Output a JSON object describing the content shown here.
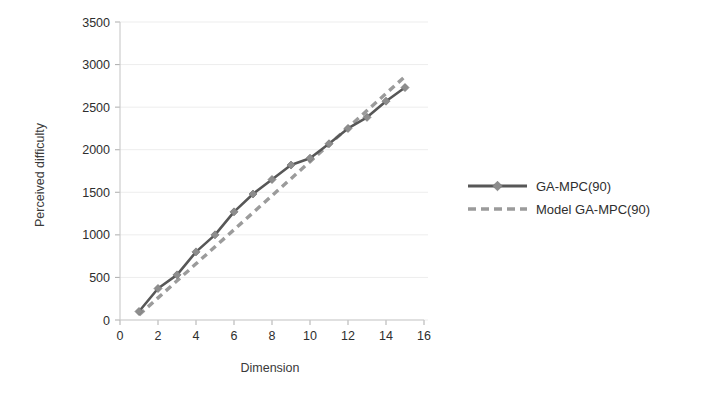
{
  "chart_data": {
    "type": "line",
    "title": "",
    "xlabel": "Dimension",
    "ylabel": "Perceived difficulty",
    "xlim": [
      0,
      16
    ],
    "ylim": [
      0,
      3500
    ],
    "xticks": [
      "0",
      "2",
      "4",
      "6",
      "8",
      "10",
      "12",
      "14",
      "16"
    ],
    "xtick_values": [
      0,
      2,
      4,
      6,
      8,
      10,
      12,
      14,
      16
    ],
    "yticks": [
      "0",
      "500",
      "1000",
      "1500",
      "2000",
      "2500",
      "3000",
      "3500"
    ],
    "ytick_values": [
      0,
      500,
      1000,
      1500,
      2000,
      2500,
      3000,
      3500
    ],
    "grid": true,
    "grid_axis": "y",
    "legend_position": "right",
    "x": [
      1,
      2,
      3,
      4,
      5,
      6,
      7,
      8,
      9,
      10,
      11,
      12,
      13,
      14,
      15
    ],
    "series": [
      {
        "name": "GA-MPC(90)",
        "style": "solid",
        "marker": "diamond",
        "color": "#575757",
        "marker_color": "#8d8d8d",
        "values": [
          100,
          370,
          530,
          800,
          1000,
          1270,
          1480,
          1650,
          1820,
          1900,
          2070,
          2250,
          2380,
          2570,
          2730
        ]
      },
      {
        "name": "Model GA-MPC(90)",
        "style": "dashed",
        "marker": "none",
        "color": "#9b9b9b",
        "values": [
          60,
          260,
          460,
          660,
          860,
          1060,
          1260,
          1460,
          1660,
          1860,
          2060,
          2260,
          2460,
          2660,
          2860
        ]
      }
    ]
  },
  "axes": {
    "x_title": "Dimension",
    "y_title": "Perceived difficulty"
  },
  "legend": {
    "items": [
      {
        "label": "GA-MPC(90)",
        "swatch": "solid-line-with-marker"
      },
      {
        "label": "Model GA-MPC(90)",
        "swatch": "dashed-line"
      }
    ]
  },
  "colors": {
    "series_solid": "#575757",
    "series_marker": "#8d8d8d",
    "series_dashed": "#9b9b9b",
    "grid": "#ededed",
    "axis": "#c9c9c9",
    "text": "#2e2e2e",
    "background": "#ffffff"
  }
}
